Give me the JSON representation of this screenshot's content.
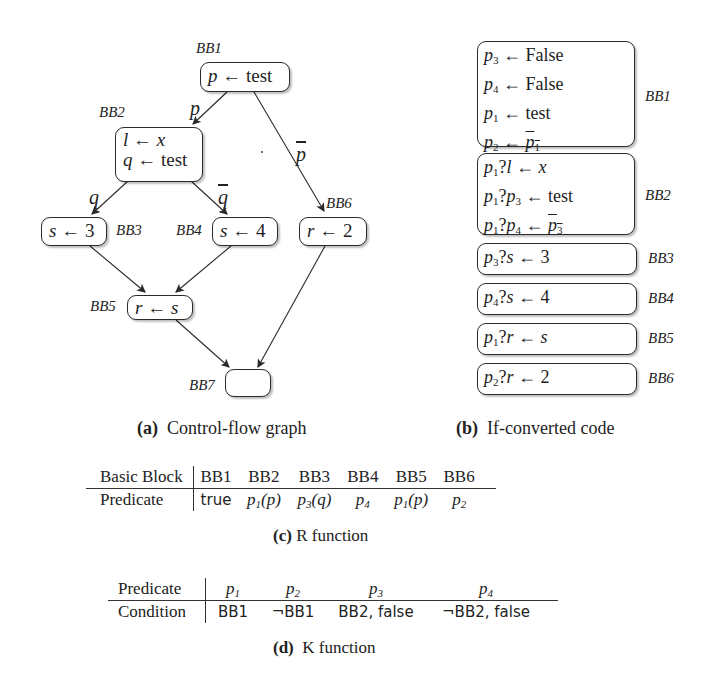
{
  "cfg": {
    "nodes": {
      "bb1": {
        "label": "BB1",
        "code": "p ← test"
      },
      "bb2": {
        "label": "BB2",
        "code_line1": "l ← x",
        "code_line2": "q ← test"
      },
      "bb3": {
        "label": "BB3",
        "code": "s ← 3"
      },
      "bb4": {
        "label": "BB4",
        "code": "s ← 4"
      },
      "bb5": {
        "label": "BB5",
        "code": "r ← s"
      },
      "bb6": {
        "label": "BB6",
        "code": "r ← 2"
      },
      "bb7": {
        "label": "BB7",
        "code": ""
      }
    },
    "edges": {
      "bb1_bb2": "p",
      "bb1_bb6": "p",
      "bb2_bb3": "q",
      "bb2_bb4": "q"
    },
    "caption_tag": "(a)",
    "caption_text": "Control-flow graph"
  },
  "ifconv": {
    "blocks": [
      {
        "label": "BB1",
        "lines": [
          "p3 ← False",
          "p4 ← False",
          "p1 ← test",
          "p2 ← ¬p1"
        ]
      },
      {
        "label": "BB2",
        "lines": [
          "p1?l ← x",
          "p1?p3 ← test",
          "p1?p4 ← ¬p3"
        ]
      },
      {
        "label": "BB3",
        "lines": [
          "p3?s ← 3"
        ]
      },
      {
        "label": "BB4",
        "lines": [
          "p4?s ← 4"
        ]
      },
      {
        "label": "BB5",
        "lines": [
          "p1?r ← s"
        ]
      },
      {
        "label": "BB6",
        "lines": [
          "p2?r ← 2"
        ]
      }
    ],
    "caption_tag": "(b)",
    "caption_text": "If-converted code"
  },
  "r_function": {
    "header_label": "Basic Block",
    "row_label": "Predicate",
    "columns": [
      "BB1",
      "BB2",
      "BB3",
      "BB4",
      "BB5",
      "BB6"
    ],
    "values": [
      "true",
      "p1(p)",
      "p3(q)",
      "p4",
      "p1(p)",
      "p2"
    ],
    "caption_tag": "(c)",
    "caption_text": "R function"
  },
  "k_function": {
    "header_label": "Predicate",
    "row_label": "Condition",
    "columns": [
      "p1",
      "p2",
      "p3",
      "p4"
    ],
    "values": [
      "BB1",
      "¬BB1",
      "BB2, false",
      "¬BB2, false"
    ],
    "caption_tag": "(d)",
    "caption_text": "K function"
  }
}
